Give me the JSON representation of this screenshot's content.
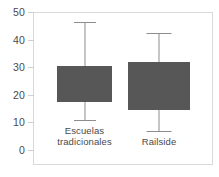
{
  "chart_data": {
    "type": "box",
    "title": "",
    "xlabel": "",
    "ylabel": "",
    "ylim": [
      0,
      50
    ],
    "yticks": [
      0,
      10,
      20,
      30,
      40,
      50
    ],
    "ytick_labels": [
      "0",
      "10",
      "20",
      "30",
      "40",
      "50"
    ],
    "grid": false,
    "legend": "none",
    "categories": [
      "Escuelas tradicionales",
      "Railside"
    ],
    "series": [
      {
        "name": "Escuelas tradicionales",
        "label_line1": "Escuelas",
        "label_line2": "tradicionales",
        "whisker_low": 11,
        "q1": 17.5,
        "q3": 30.5,
        "whisker_high": 46.5
      },
      {
        "name": "Railside",
        "label_line1": "Railside",
        "label_line2": "",
        "whisker_low": 7,
        "q1": 14.5,
        "q3": 32,
        "whisker_high": 42.5
      }
    ],
    "colors": {
      "box_fill": "#575757",
      "whisker": "#8d8d8d",
      "frame": "#d9d9d9",
      "text": "#4a4a4a",
      "background": "#ffffff"
    }
  }
}
